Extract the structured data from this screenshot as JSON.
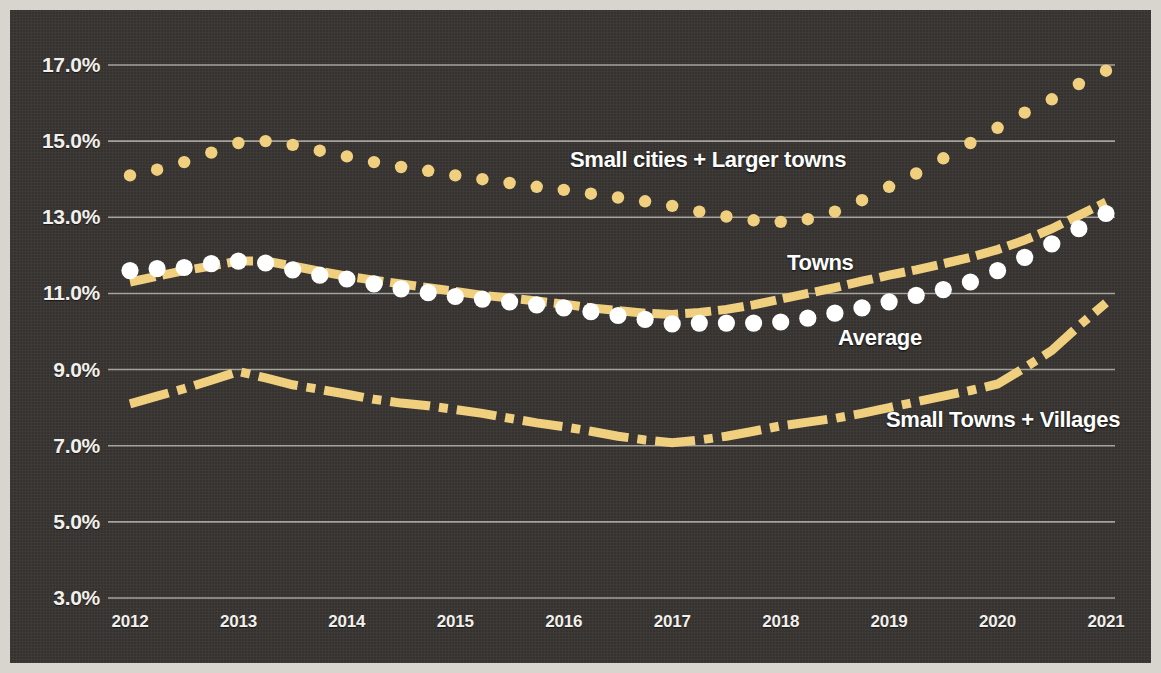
{
  "chart_data": {
    "type": "line",
    "title": "",
    "subtitle": "",
    "xlabel": "",
    "ylabel": "",
    "grid": true,
    "legend_position": "inline-annotations",
    "background_color": "#35322f",
    "accent_color": "#f0cf7e",
    "average_marker_color": "#ffffff",
    "gridline_color": "#b9b6b0",
    "axis_label_color": "#f2f0ec",
    "x": [
      2012,
      2012.25,
      2012.5,
      2012.75,
      2013,
      2013.25,
      2013.5,
      2013.75,
      2014,
      2014.25,
      2014.5,
      2014.75,
      2015,
      2015.25,
      2015.5,
      2015.75,
      2016,
      2016.25,
      2016.5,
      2016.75,
      2017,
      2017.25,
      2017.5,
      2017.75,
      2018,
      2018.25,
      2018.5,
      2018.75,
      2019,
      2019.25,
      2019.5,
      2019.75,
      2020,
      2020.25,
      2020.5,
      2020.75,
      2021
    ],
    "x_tick_values": [
      2012,
      2013,
      2014,
      2015,
      2016,
      2017,
      2018,
      2019,
      2020,
      2021
    ],
    "x_tick_labels": [
      "2012",
      "2013",
      "2014",
      "2015",
      "2016",
      "2017",
      "2018",
      "2019",
      "2020",
      "2021"
    ],
    "y_tick_values": [
      3.0,
      5.0,
      7.0,
      9.0,
      11.0,
      13.0,
      15.0,
      17.0
    ],
    "y_tick_labels": [
      "3.0%",
      "5.0%",
      "7.0%",
      "9.0%",
      "11.0%",
      "13.0%",
      "15.0%",
      "17.0%"
    ],
    "ylim": [
      3.0,
      17.5
    ],
    "xlim": [
      2012,
      2021
    ],
    "series": [
      {
        "name": "Small cities + Larger towns",
        "style": "dotted",
        "color": "#f0cf7e",
        "label_x": 2017.0,
        "label_y": 14.55,
        "values": [
          14.1,
          14.25,
          14.45,
          14.7,
          14.95,
          15.0,
          14.9,
          14.75,
          14.6,
          14.45,
          14.32,
          14.22,
          14.1,
          14.0,
          13.9,
          13.8,
          13.72,
          13.62,
          13.52,
          13.42,
          13.3,
          13.15,
          13.02,
          12.92,
          12.88,
          12.95,
          13.15,
          13.45,
          13.8,
          14.15,
          14.55,
          14.95,
          15.35,
          15.75,
          16.1,
          16.5,
          16.85
        ]
      },
      {
        "name": "Towns",
        "style": "dash-line",
        "color": "#f0cf7e",
        "label_x": 2018.2,
        "label_y": 12.35,
        "values": [
          11.3,
          11.45,
          11.6,
          11.72,
          11.85,
          11.85,
          11.72,
          11.58,
          11.45,
          11.35,
          11.25,
          11.15,
          11.05,
          10.95,
          10.88,
          10.8,
          10.72,
          10.62,
          10.55,
          10.48,
          10.45,
          10.5,
          10.58,
          10.7,
          10.85,
          11.0,
          11.15,
          11.32,
          11.48,
          11.62,
          11.78,
          11.95,
          12.15,
          12.4,
          12.7,
          13.05,
          13.4
        ]
      },
      {
        "name": "Average",
        "style": "dots-markers",
        "color": "#ffffff",
        "label_x": 2018.7,
        "label_y": 10.05,
        "values": [
          11.6,
          11.65,
          11.68,
          11.78,
          11.85,
          11.8,
          11.62,
          11.48,
          11.38,
          11.25,
          11.12,
          11.02,
          10.92,
          10.85,
          10.78,
          10.7,
          10.62,
          10.52,
          10.42,
          10.32,
          10.2,
          10.22,
          10.22,
          10.22,
          10.25,
          10.35,
          10.48,
          10.62,
          10.78,
          10.95,
          11.1,
          11.3,
          11.6,
          11.95,
          12.3,
          12.7,
          13.1
        ]
      },
      {
        "name": "Small Towns + Villages",
        "style": "dash-dot-line",
        "color": "#f0cf7e",
        "label_x": 2019.2,
        "label_y": 7.6,
        "values": [
          8.1,
          8.3,
          8.5,
          8.72,
          8.95,
          8.78,
          8.6,
          8.48,
          8.35,
          8.22,
          8.12,
          8.05,
          7.95,
          7.85,
          7.72,
          7.6,
          7.5,
          7.38,
          7.25,
          7.15,
          7.08,
          7.15,
          7.25,
          7.38,
          7.52,
          7.62,
          7.72,
          7.85,
          8.0,
          8.15,
          8.3,
          8.45,
          8.62,
          9.05,
          9.5,
          10.15,
          10.75
        ]
      }
    ]
  }
}
